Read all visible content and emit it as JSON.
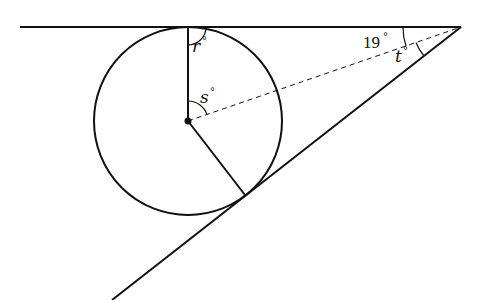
{
  "diagram": {
    "labels": {
      "r": "r",
      "s": "s",
      "t": "t",
      "angle_19": "19",
      "degree_symbol": "°"
    },
    "given_angle_degrees": 19,
    "colors": {
      "stroke": "#111111",
      "background": "#ffffff"
    },
    "geometry": {
      "circle_center": [
        188,
        121
      ],
      "circle_radius": 94,
      "vertex": [
        461,
        27
      ],
      "top_line_start": [
        20,
        27
      ],
      "bottom_line_end": [
        112,
        300
      ],
      "top_tangent_point": [
        188,
        27
      ],
      "bottom_tangent_point": [
        245,
        195
      ]
    }
  }
}
